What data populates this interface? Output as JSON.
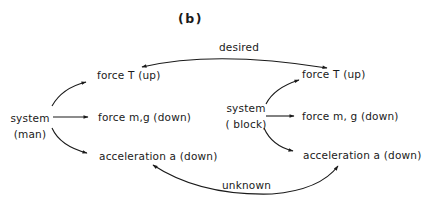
{
  "panel_label": "(b)",
  "relations": {
    "top": "desired",
    "bottom": "unknown"
  },
  "left_system": {
    "name_line1": "system",
    "name_line2": "(man)",
    "outputs": [
      "force T (up)",
      "force m,g (down)",
      "acceleration a (down)"
    ]
  },
  "right_system": {
    "name_line1": "system",
    "name_line2": "( block)",
    "outputs": [
      "force T (up)",
      "force m, g (down)",
      "acceleration a (down)"
    ]
  },
  "colors": {
    "ink": "#1a1a1a",
    "background": "#ffffff"
  }
}
